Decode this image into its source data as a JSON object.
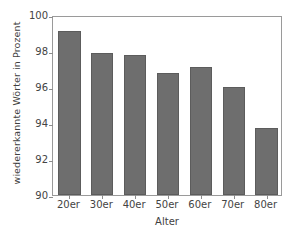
{
  "chart_data": {
    "type": "bar",
    "title": "",
    "xlabel": "Alter",
    "ylabel": "wiedererkannte Wörter in Prozent",
    "categories": [
      "20er",
      "30er",
      "40er",
      "50er",
      "60er",
      "70er",
      "80er"
    ],
    "values": [
      99.1,
      97.9,
      97.8,
      96.8,
      97.1,
      96.0,
      93.7
    ],
    "ylim": [
      90,
      100
    ],
    "yticks": [
      90,
      92,
      94,
      96,
      98,
      100
    ],
    "ytick_labels": [
      "90",
      "92",
      "94",
      "96",
      "98",
      "100"
    ],
    "grid": false,
    "legend": null,
    "bar_color": "#6e6e6e",
    "bar_edge_color": "#5c5c5c",
    "axis_color": "#9a9a9a",
    "background_color": "#ffffff"
  }
}
